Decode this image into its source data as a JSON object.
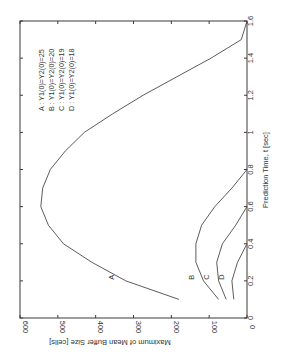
{
  "chart_data": {
    "type": "line",
    "title": "",
    "xlabel": "Prediction Time, t [sec]",
    "ylabel": "Maximum of Mean Buffer Size [cells]",
    "xlim": [
      0,
      1.6
    ],
    "ylim": [
      0,
      600
    ],
    "xticks": [
      "0",
      "0.2",
      "0.4",
      "0.6",
      "0.8",
      "1",
      "1.2",
      "1.4",
      "1.6"
    ],
    "yticks": [
      "0",
      "100",
      "200",
      "300",
      "400",
      "500",
      "600"
    ],
    "grid": false,
    "orientation": "rotated 90 degrees clockwise (y-axis along bottom, x-axis along right side)",
    "legend_position": "inside upper area",
    "legend": [
      "A : Y1(0)=Y2(0)=25",
      "B : Y1(0)=Y2(0)=20",
      "C : Y1(0)=Y2(0)=19",
      "D : Y1(0)=Y2(0)=18"
    ],
    "series": [
      {
        "name": "A",
        "label": "A : Y1(0)=Y2(0)=25",
        "x": [
          0.1,
          0.2,
          0.3,
          0.4,
          0.5,
          0.6,
          0.7,
          0.8,
          0.9,
          1.0,
          1.1,
          1.2,
          1.3,
          1.4,
          1.5,
          1.6
        ],
        "y": [
          180,
          320,
          410,
          485,
          525,
          545,
          540,
          520,
          480,
          430,
          355,
          275,
          185,
          95,
          15,
          0
        ]
      },
      {
        "name": "B",
        "label": "B : Y1(0)=Y2(0)=20",
        "x": [
          0.1,
          0.2,
          0.3,
          0.4,
          0.5,
          0.6,
          0.7,
          0.8
        ],
        "y": [
          75,
          115,
          135,
          135,
          120,
          85,
          40,
          0
        ]
      },
      {
        "name": "C",
        "label": "C : Y1(0)=Y2(0)=19",
        "x": [
          0.1,
          0.2,
          0.3,
          0.4,
          0.5,
          0.6
        ],
        "y": [
          55,
          75,
          80,
          65,
          30,
          0
        ]
      },
      {
        "name": "D",
        "label": "D : Y1(0)=Y2(0)=18",
        "x": [
          0.1,
          0.2,
          0.3,
          0.4
        ],
        "y": [
          35,
          40,
          25,
          0
        ]
      }
    ],
    "curve_labels": [
      {
        "text": "A",
        "x": 0.22,
        "y": 345
      },
      {
        "text": "B",
        "x": 0.22,
        "y": 135
      },
      {
        "text": "C",
        "x": 0.22,
        "y": 95
      },
      {
        "text": "D",
        "x": 0.22,
        "y": 55
      }
    ]
  }
}
